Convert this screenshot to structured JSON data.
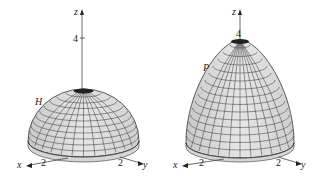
{
  "figures": [
    {
      "name": "hemisphere",
      "surface_label": "H",
      "axes": {
        "x": "x",
        "y": "y",
        "z": "z"
      },
      "ticks": {
        "z": "4",
        "x": "2",
        "y": "2"
      }
    },
    {
      "name": "paraboloid",
      "surface_label": "P",
      "axes": {
        "x": "x",
        "y": "y",
        "z": "z"
      },
      "ticks": {
        "z": "4",
        "x": "2",
        "y": "2"
      }
    }
  ],
  "colors": {
    "surface": "#d9d9d9",
    "mesh": "#333333",
    "axis": "#444444"
  }
}
